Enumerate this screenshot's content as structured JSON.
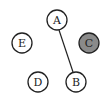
{
  "graph": {
    "nodes": [
      {
        "id": "A",
        "label": "A",
        "cx": 57,
        "cy": 20,
        "fill": "#ffffff"
      },
      {
        "id": "E",
        "label": "E",
        "cx": 22,
        "cy": 43,
        "fill": "#ffffff"
      },
      {
        "id": "C",
        "label": "C",
        "cx": 89,
        "cy": 43,
        "fill": "#8a8a8a"
      },
      {
        "id": "D",
        "label": "D",
        "cx": 38,
        "cy": 82,
        "fill": "#ffffff"
      },
      {
        "id": "B",
        "label": "B",
        "cx": 76,
        "cy": 82,
        "fill": "#ffffff"
      }
    ],
    "edges": [
      {
        "from": "A",
        "to": "B"
      }
    ],
    "colors": {
      "stroke": "#222222",
      "highlight": "#8a8a8a",
      "default_fill": "#ffffff"
    }
  }
}
